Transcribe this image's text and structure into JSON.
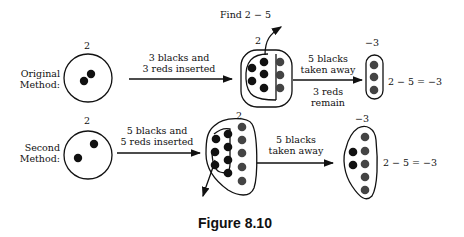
{
  "title": "Find 2 − 5",
  "caption": "Figure 8.10",
  "rows": [
    {
      "method_label_line1": "Original",
      "method_label_line2": "Method:",
      "start_count": "2",
      "step1_line1": "3 blacks and",
      "step1_line2": "3 reds inserted",
      "middle_count": "2",
      "step2_line1": "5 blacks",
      "step2_line2": "taken away",
      "step2_note_line1": "3 reds",
      "step2_note_line2": "remain",
      "result_count": "−3",
      "equation": "2 − 5 = −3"
    },
    {
      "method_label_line1": "Second",
      "method_label_line2": "Method:",
      "start_count": "2",
      "step1_line1": "5 blacks and",
      "step1_line2": "5 reds inserted",
      "middle_count": "2",
      "step2_line1": "5 blacks",
      "step2_line2": "taken away",
      "result_count": "−3",
      "equation": "2 − 5 = −3"
    }
  ],
  "colors": {
    "black_chip": "#111111",
    "red_chip": "#444444",
    "line": "#111111"
  }
}
